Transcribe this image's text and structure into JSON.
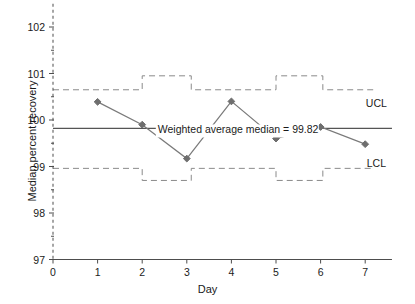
{
  "chart_data": {
    "type": "line",
    "title": "",
    "xlabel": "Day",
    "ylabel": "Median percent recovery",
    "xlim": [
      0,
      7.6
    ],
    "ylim": [
      97,
      102.5
    ],
    "grid": false,
    "legend": "none",
    "x": [
      1,
      2,
      3,
      4,
      5,
      6,
      7
    ],
    "categories": [
      "1",
      "2",
      "3",
      "4",
      "5",
      "6",
      "7"
    ],
    "series": [
      {
        "name": "Median percent recovery",
        "values": [
          100.39,
          99.9,
          99.17,
          100.4,
          99.6,
          99.85,
          99.48
        ],
        "marker": "diamond",
        "color": "#7a7a7a"
      }
    ],
    "xticks": [
      0,
      1,
      2,
      3,
      4,
      5,
      6,
      7
    ],
    "xtick_labels": [
      "0",
      "1",
      "2",
      "3",
      "4",
      "5",
      "6",
      "7"
    ],
    "yticks": [
      97,
      98,
      99,
      100,
      101,
      102
    ],
    "ytick_labels": [
      "97",
      "98",
      "99",
      "100",
      "101",
      "102"
    ],
    "center_line": {
      "label": "Weighted average median = 99.82",
      "value": 99.82
    },
    "control_limits": {
      "ucl_label": "UCL",
      "lcl_label": "LCL",
      "ucl_steps": [
        {
          "x_start": 0.0,
          "x_end": 2.0,
          "value": 100.65
        },
        {
          "x_start": 2.0,
          "x_end": 3.1,
          "value": 100.95
        },
        {
          "x_start": 3.1,
          "x_end": 5.0,
          "value": 100.65
        },
        {
          "x_start": 5.0,
          "x_end": 6.05,
          "value": 100.95
        },
        {
          "x_start": 6.05,
          "x_end": 7.2,
          "value": 100.65
        }
      ],
      "lcl_steps": [
        {
          "x_start": 0.0,
          "x_end": 2.0,
          "value": 98.96
        },
        {
          "x_start": 2.0,
          "x_end": 3.1,
          "value": 98.7
        },
        {
          "x_start": 3.1,
          "x_end": 5.0,
          "value": 98.96
        },
        {
          "x_start": 5.0,
          "x_end": 6.05,
          "value": 98.7
        },
        {
          "x_start": 6.05,
          "x_end": 7.2,
          "value": 98.96
        }
      ]
    },
    "annotations": [
      {
        "text": "UCL",
        "x": 7.25,
        "y": 100.28
      },
      {
        "text": "LCL",
        "x": 7.25,
        "y": 99.0
      },
      {
        "text": "Weighted average median = 99.82",
        "x": 2.35,
        "y": 99.71
      }
    ],
    "colors": {
      "series_line": "#7a7a7a",
      "marker": "#6e6e6e",
      "center_line": "#555555",
      "limits": "#8a8a8a",
      "axis": "#4d4d4d",
      "text": "#1a1a1a"
    }
  }
}
